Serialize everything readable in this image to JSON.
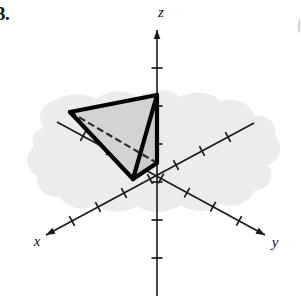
{
  "problem": {
    "number": "3.",
    "edge_mark": "("
  },
  "figure": {
    "background_color": "#ffffff",
    "plane_fill": "#ececec",
    "face_fill": "#d2d2d2",
    "axis_color": "#1a1a1a",
    "solid_edge_color": "#000000",
    "axis_labels": {
      "x": "x",
      "y": "y",
      "z": "z"
    },
    "axes": [
      {
        "name": "z-axis",
        "label": "z",
        "label_x": 161,
        "label_y": 17,
        "x1": 157,
        "y1": 30,
        "x2": 157,
        "y2": 296,
        "arrow_at": "start",
        "tick_count": 6
      },
      {
        "name": "x-axis",
        "label": "x",
        "label_x": 37,
        "label_y": 246,
        "x1": 254,
        "y1": 123,
        "x2": 46,
        "y2": 235,
        "arrow_at": "end",
        "tick_count": 7
      },
      {
        "name": "y-axis",
        "label": "y",
        "label_x": 275,
        "label_y": 247,
        "x1": 57,
        "y1": 122,
        "x2": 265,
        "y2": 235,
        "arrow_at": "end",
        "tick_count": 7
      }
    ],
    "tetrahedron": {
      "vertices": [
        {
          "name": "vertex-on-negative-y-axis",
          "x": 70,
          "y": 112
        },
        {
          "name": "vertex-on-z-axis",
          "x": 157,
          "y": 95
        },
        {
          "name": "vertex-on-x-axis",
          "x": 133,
          "y": 179
        },
        {
          "name": "vertex-origin",
          "x": 157,
          "y": 163
        }
      ],
      "edges": [
        {
          "name": "edge-left-to-top",
          "from": 0,
          "to": 1,
          "style": "solid"
        },
        {
          "name": "edge-left-to-bottom",
          "from": 0,
          "to": 2,
          "style": "solid"
        },
        {
          "name": "edge-top-to-bottom",
          "from": 1,
          "to": 2,
          "style": "solid"
        },
        {
          "name": "edge-top-to-origin",
          "from": 1,
          "to": 3,
          "style": "solid"
        },
        {
          "name": "edge-bottom-to-origin",
          "from": 2,
          "to": 3,
          "style": "solid"
        },
        {
          "name": "edge-left-to-origin",
          "from": 0,
          "to": 3,
          "style": "hidden"
        }
      ],
      "shaded_face": "left-top-bottom"
    },
    "plane_region": {
      "name": "shaded-plane-blob",
      "path": "M 44 128 C 36 118 40 104 56 100 C 66 93 84 92 96 99 C 108 90 126 89 138 97 C 150 88 170 88 180 97 C 194 90 212 92 221 101 C 236 97 252 104 254 116 C 268 114 278 124 275 136 C 284 146 281 160 268 165 C 276 177 268 190 254 191 C 250 203 234 209 221 204 C 210 213 192 213 181 205 C 168 214 148 214 137 206 C 124 214 106 213 96 205 C 83 212 66 208 60 197 C 46 198 35 188 37 176 C 26 170 24 155 34 147 C 30 139 34 130 44 128 Z"
    }
  }
}
